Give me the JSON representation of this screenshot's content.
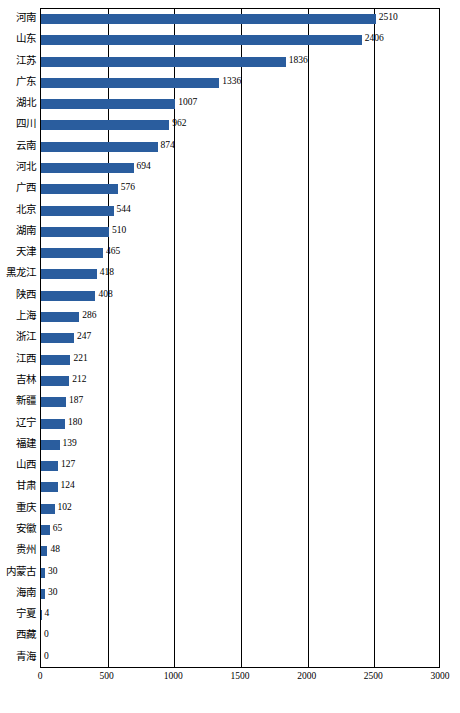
{
  "chart_data": {
    "type": "bar",
    "orientation": "horizontal",
    "title": "",
    "subtitle": "",
    "xlabel": "",
    "ylabel": "",
    "xlim": [
      0,
      3000
    ],
    "ylim": null,
    "grid": true,
    "gridlines_axis": "x",
    "legend": null,
    "bar_color": "#2a5d9e",
    "xticks": [
      "0",
      "500",
      "1000",
      "1500",
      "2000",
      "2500",
      "3000"
    ],
    "xtick_values": [
      0,
      500,
      1000,
      1500,
      2000,
      2500,
      3000
    ],
    "categories": [
      "河南",
      "山东",
      "江苏",
      "广东",
      "湖北",
      "四川",
      "云南",
      "河北",
      "广西",
      "北京",
      "湖南",
      "天津",
      "黑龙江",
      "陕西",
      "上海",
      "浙江",
      "江西",
      "吉林",
      "新疆",
      "辽宁",
      "福建",
      "山西",
      "甘肃",
      "重庆",
      "安徽",
      "贵州",
      "内蒙古",
      "海南",
      "宁夏",
      "西藏",
      "青海"
    ],
    "values": [
      2510,
      2406,
      1836,
      1336,
      1007,
      962,
      874,
      694,
      576,
      544,
      510,
      465,
      418,
      408,
      286,
      247,
      221,
      212,
      187,
      180,
      139,
      127,
      124,
      102,
      65,
      48,
      30,
      30,
      4,
      0,
      0
    ],
    "value_labels": [
      "2510",
      "2406",
      "1836",
      "1336",
      "1007",
      "962",
      "874",
      "694",
      "576",
      "544",
      "510",
      "465",
      "418",
      "408",
      "286",
      "247",
      "221",
      "212",
      "187",
      "180",
      "139",
      "127",
      "124",
      "102",
      "65",
      "48",
      "30",
      "30",
      "4",
      "0",
      "0"
    ]
  }
}
